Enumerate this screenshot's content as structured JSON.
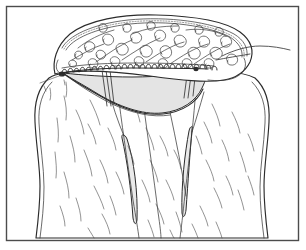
{
  "figure": {
    "caption": "Elevated flap reflected superiorly with a running edge suture; shaded cavity beneath; underlying muscle fascia with striations",
    "width": 306,
    "height": 250,
    "background_color": "#ffffff",
    "frame_color": "#4c4c4c",
    "ink_color": "#2b2b2b",
    "shade_color": "#e7e7e7",
    "cavity_shade_color": "#e4e4e4"
  },
  "regions": {
    "flap": {
      "name": "Reflected skin and fat flap",
      "texture": "cursive loop scribbles representing fat lobules",
      "fill": "#ffffff"
    },
    "suture_line": {
      "name": "Running edge suture",
      "stitch_count": 26,
      "stitch_style": "loop stitches along the cut flap margin"
    },
    "cavity": {
      "name": "Shaded surgical cavity",
      "fill": "#e4e4e4"
    },
    "fascia": {
      "name": "Underlying muscle fascia",
      "texture": "fine striation lines",
      "fill": "#ffffff"
    },
    "vessels": {
      "name": "Elongated shaded structures on fascia",
      "count": 2,
      "fill": "#e9e9e9"
    },
    "thread_tail": {
      "name": "Free suture thread tail exiting to the right"
    },
    "strands": {
      "name": "Vertical suture strands crossing the cavity",
      "count": 4
    }
  }
}
